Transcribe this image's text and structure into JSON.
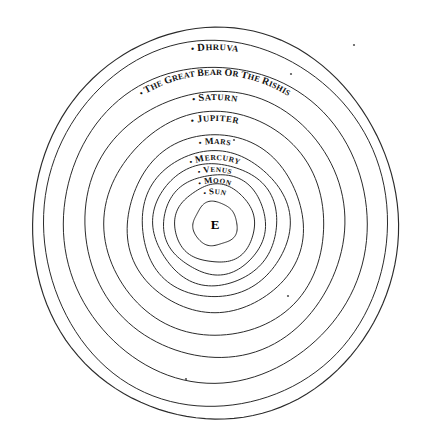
{
  "figure": {
    "type": "concentric-orbit-diagram",
    "center_label": "E",
    "geometry": {
      "center_x": 215,
      "center_y": 224,
      "unit": "px"
    }
  },
  "rings": [
    {
      "index": 0,
      "label": "",
      "radius_x": 183,
      "radius_y": 196,
      "marker": false
    },
    {
      "index": 1,
      "label": "Dhruva",
      "radius_x": 172,
      "radius_y": 183,
      "marker": true
    },
    {
      "index": 2,
      "label": "The Great Bear or the Rishis",
      "radius_x": 152,
      "radius_y": 158,
      "marker": true
    },
    {
      "index": 3,
      "label": "Saturn",
      "radius_x": 130,
      "radius_y": 133,
      "marker": true
    },
    {
      "index": 4,
      "label": "Jupiter",
      "radius_x": 110,
      "radius_y": 112,
      "marker": true
    },
    {
      "index": 5,
      "label": "Mars",
      "radius_x": 88,
      "radius_y": 89,
      "marker": true
    },
    {
      "index": 6,
      "label": "Mercury",
      "radius_x": 74,
      "radius_y": 73,
      "marker": true
    },
    {
      "index": 7,
      "label": "Venus",
      "radius_x": 62,
      "radius_y": 61,
      "marker": true
    },
    {
      "index": 8,
      "label": "Moon",
      "radius_x": 51,
      "radius_y": 50,
      "marker": true
    },
    {
      "index": 9,
      "label": "Sun",
      "radius_x": 40,
      "radius_y": 39,
      "marker": true
    },
    {
      "index": 10,
      "label": "",
      "radius_x": 22,
      "radius_y": 22,
      "marker": false
    }
  ],
  "specks": [
    {
      "x": 354,
      "y": 45
    },
    {
      "x": 291,
      "y": 74
    },
    {
      "x": 288,
      "y": 296
    },
    {
      "x": 186,
      "y": 379
    },
    {
      "x": 234,
      "y": 140
    }
  ],
  "colors": {
    "ink": "#2b2b2b",
    "text": "#111111",
    "background": "#ffffff"
  }
}
